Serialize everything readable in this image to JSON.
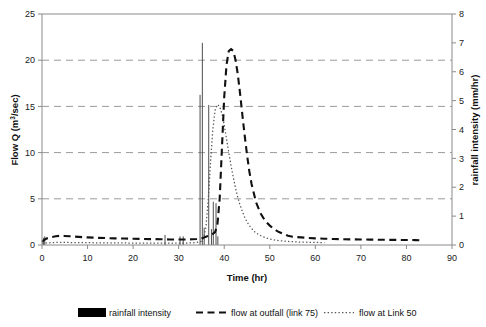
{
  "chart_data": {
    "type": "line",
    "title": "",
    "xlabel": "Time (hr)",
    "ylabel": "Flow Q (m3/sec)",
    "ylabel_display": "Flow Q (m",
    "ylabel_sup": "3",
    "ylabel_tail": "/sec)",
    "y2label": "rainfall intensity (mm/hr)",
    "xlim": [
      0,
      90
    ],
    "ylim": [
      0,
      25
    ],
    "y2lim": [
      0,
      8
    ],
    "xticks": [
      0,
      10,
      20,
      30,
      40,
      50,
      60,
      70,
      80,
      90
    ],
    "yticks": [
      0,
      5,
      10,
      15,
      20,
      25
    ],
    "y2ticks": [
      0,
      1,
      2,
      3,
      4,
      5,
      6,
      7,
      8
    ],
    "grid": "horizontal dashed at left-axis y = 5, 10, 15, 20",
    "gridlines": [
      5,
      10,
      15,
      20
    ],
    "legend_position": "bottom",
    "legend": [
      {
        "name": "rainfall intensity",
        "marker": "filled-bar",
        "axis": "right"
      },
      {
        "name": "flow at outfall (link 75)",
        "marker": "dashed-line",
        "axis": "left"
      },
      {
        "name": "flow at Link 50",
        "marker": "dotted-line",
        "axis": "left"
      }
    ],
    "series": [
      {
        "name": "flow at outfall (link 75)",
        "style": "dashed",
        "axis": "left",
        "color": "#111111",
        "x": [
          0,
          0.5,
          1,
          2,
          3,
          4,
          5,
          6,
          7,
          8,
          9,
          10,
          12,
          14,
          16,
          18,
          20,
          22,
          24,
          26,
          27,
          28,
          30,
          31,
          32,
          33,
          34,
          35,
          35.5,
          36,
          36.5,
          37,
          37.5,
          38,
          38.5,
          39,
          39.5,
          40,
          40.5,
          41,
          41.5,
          42,
          42.5,
          43,
          43.5,
          44,
          44.5,
          45,
          45.5,
          46,
          47,
          48,
          49,
          50,
          51,
          52,
          53,
          54,
          55,
          56,
          58,
          60,
          62,
          64,
          66,
          68,
          70,
          72,
          74,
          76,
          78,
          80,
          82,
          83
        ],
        "y": [
          0.35,
          0.55,
          0.7,
          0.85,
          0.95,
          1.0,
          0.98,
          0.95,
          0.92,
          0.88,
          0.85,
          0.82,
          0.78,
          0.75,
          0.72,
          0.7,
          0.68,
          0.66,
          0.64,
          0.62,
          0.62,
          0.6,
          0.6,
          0.6,
          0.6,
          0.62,
          0.65,
          0.7,
          0.8,
          0.9,
          1.0,
          1.1,
          1.2,
          1.4,
          2.2,
          5.0,
          10.5,
          16.0,
          19.5,
          21.0,
          21.2,
          21.0,
          20.0,
          18.4,
          16.3,
          14.0,
          11.8,
          9.8,
          8.0,
          6.6,
          4.6,
          3.4,
          2.6,
          2.1,
          1.7,
          1.4,
          1.2,
          1.0,
          0.9,
          0.85,
          0.78,
          0.72,
          0.68,
          0.65,
          0.63,
          0.61,
          0.6,
          0.58,
          0.57,
          0.56,
          0.55,
          0.54,
          0.53,
          0.52
        ]
      },
      {
        "name": "flow at Link 50",
        "style": "dotted",
        "axis": "left",
        "color": "#555555",
        "x": [
          0,
          1,
          2,
          3,
          4,
          5,
          6,
          8,
          10,
          12,
          14,
          16,
          18,
          20,
          22,
          24,
          26,
          28,
          30,
          32,
          33,
          34,
          35,
          35.5,
          36,
          36.5,
          37,
          37.5,
          38,
          38.5,
          39,
          39.5,
          40,
          40.5,
          41,
          41.5,
          42,
          42.5,
          43,
          43.5,
          44,
          44.5,
          45,
          45.5,
          46,
          46.5,
          47,
          48,
          49,
          50,
          51,
          52,
          53,
          54,
          56,
          58,
          60,
          62
        ],
        "y": [
          0.2,
          0.22,
          0.25,
          0.27,
          0.28,
          0.28,
          0.27,
          0.26,
          0.25,
          0.24,
          0.23,
          0.22,
          0.22,
          0.21,
          0.21,
          0.2,
          0.2,
          0.2,
          0.2,
          0.21,
          0.23,
          0.28,
          0.4,
          0.8,
          2.0,
          5.0,
          9.0,
          12.5,
          14.6,
          15.2,
          15.0,
          14.2,
          13.0,
          11.5,
          10.0,
          8.6,
          7.3,
          6.1,
          5.1,
          4.3,
          3.6,
          3.0,
          2.5,
          2.1,
          1.8,
          1.5,
          1.3,
          1.0,
          0.8,
          0.65,
          0.55,
          0.48,
          0.42,
          0.38,
          0.33,
          0.3,
          0.28,
          0.26
        ]
      }
    ],
    "rainfall_bars": {
      "name": "rainfall intensity",
      "axis": "right",
      "units": "mm/hr",
      "color": "#4d4d4d",
      "x": [
        0.3,
        0.6,
        27.0,
        30.3,
        31.0,
        34.7,
        35.2,
        35.6,
        36.6,
        37.2,
        37.6,
        38.2,
        38.6
      ],
      "y": [
        0.25,
        0.3,
        0.35,
        0.3,
        0.3,
        5.2,
        7.0,
        0.6,
        4.85,
        0.55,
        1.5,
        1.45,
        0.3
      ]
    }
  }
}
